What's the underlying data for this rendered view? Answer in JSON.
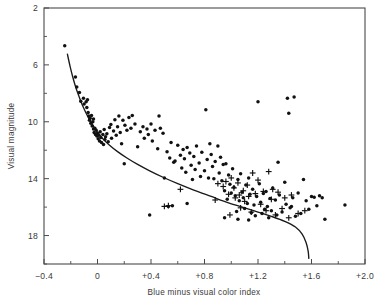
{
  "chart_data": {
    "type": "scatter",
    "title": "",
    "xlabel": "Blue minus visual color index",
    "ylabel": "Visual magnitude",
    "xlim": [
      -0.4,
      2.0
    ],
    "ylim": [
      2,
      20
    ],
    "y_inverted": true,
    "grid": false,
    "legend": "none",
    "xticks": [
      -0.4,
      0,
      0.4,
      0.8,
      1.2,
      1.6,
      2.0
    ],
    "xtick_labels": [
      "−0.4",
      "0",
      "+0.4",
      "+0.8",
      "+1.2",
      "+1.6",
      "+2.0"
    ],
    "yticks": [
      2,
      6,
      10,
      14,
      18
    ],
    "ytick_labels": [
      "2",
      "6",
      "10",
      "14",
      "18"
    ],
    "x_minor_interval": 0.2,
    "y_minor_interval": 2,
    "series": [
      {
        "name": "dot-markers",
        "marker": "dot",
        "points": [
          [
            -0.245,
            4.65
          ],
          [
            -0.165,
            6.85
          ],
          [
            -0.155,
            7.55
          ],
          [
            -0.135,
            7.95
          ],
          [
            -0.125,
            8.55
          ],
          [
            -0.105,
            8.35
          ],
          [
            -0.1,
            8.75
          ],
          [
            -0.085,
            8.6
          ],
          [
            -0.08,
            9.0
          ],
          [
            -0.075,
            8.45
          ],
          [
            -0.07,
            9.35
          ],
          [
            -0.065,
            9.6
          ],
          [
            -0.06,
            9.9
          ],
          [
            -0.055,
            9.75
          ],
          [
            -0.05,
            10.1
          ],
          [
            -0.045,
            9.55
          ],
          [
            -0.04,
            10.3
          ],
          [
            -0.035,
            10.0
          ],
          [
            -0.03,
            10.5
          ],
          [
            -0.03,
            9.8
          ],
          [
            -0.025,
            10.75
          ],
          [
            -0.02,
            10.45
          ],
          [
            -0.015,
            10.9
          ],
          [
            -0.01,
            10.6
          ],
          [
            -0.005,
            11.0
          ],
          [
            0.0,
            10.8
          ],
          [
            0.005,
            11.2
          ],
          [
            0.01,
            10.95
          ],
          [
            0.015,
            11.35
          ],
          [
            0.02,
            10.7
          ],
          [
            0.025,
            11.1
          ],
          [
            0.03,
            11.45
          ],
          [
            0.04,
            10.9
          ],
          [
            0.045,
            11.6
          ],
          [
            0.05,
            10.55
          ],
          [
            0.055,
            11.25
          ],
          [
            0.06,
            11.05
          ],
          [
            0.07,
            10.85
          ],
          [
            0.08,
            11.4
          ],
          [
            0.09,
            10.4
          ],
          [
            0.1,
            10.2
          ],
          [
            0.105,
            11.15
          ],
          [
            0.12,
            10.65
          ],
          [
            0.13,
            9.85
          ],
          [
            0.14,
            10.95
          ],
          [
            0.15,
            10.35
          ],
          [
            0.16,
            9.6
          ],
          [
            0.17,
            10.75
          ],
          [
            0.18,
            11.55
          ],
          [
            0.19,
            9.9
          ],
          [
            0.2,
            12.95
          ],
          [
            0.205,
            10.25
          ],
          [
            0.22,
            10.6
          ],
          [
            0.235,
            9.7
          ],
          [
            0.25,
            10.45
          ],
          [
            0.26,
            9.55
          ],
          [
            0.28,
            10.15
          ],
          [
            0.3,
            11.75
          ],
          [
            0.32,
            10.7
          ],
          [
            0.34,
            10.35
          ],
          [
            0.35,
            11.15
          ],
          [
            0.37,
            10.5
          ],
          [
            0.38,
            10.9
          ],
          [
            0.4,
            10.15
          ],
          [
            0.41,
            11.35
          ],
          [
            0.43,
            10.6
          ],
          [
            0.45,
            11.9
          ],
          [
            0.46,
            9.6
          ],
          [
            0.47,
            10.45
          ],
          [
            0.49,
            10.8
          ],
          [
            0.5,
            13.95
          ],
          [
            0.52,
            12.1
          ],
          [
            0.54,
            12.55
          ],
          [
            0.55,
            11.45
          ],
          [
            0.57,
            12.85
          ],
          [
            0.58,
            12.75
          ],
          [
            0.6,
            11.65
          ],
          [
            0.62,
            12.35
          ],
          [
            0.63,
            13.25
          ],
          [
            0.64,
            11.95
          ],
          [
            0.65,
            12.6
          ],
          [
            0.66,
            13.55
          ],
          [
            0.67,
            11.8
          ],
          [
            0.69,
            12.2
          ],
          [
            0.7,
            13.05
          ],
          [
            0.71,
            14.05
          ],
          [
            0.72,
            12.45
          ],
          [
            0.73,
            13.35
          ],
          [
            0.74,
            11.7
          ],
          [
            0.76,
            12.9
          ],
          [
            0.77,
            13.85
          ],
          [
            0.78,
            12.15
          ],
          [
            0.8,
            13.45
          ],
          [
            0.81,
            9.15
          ],
          [
            0.82,
            12.65
          ],
          [
            0.83,
            13.95
          ],
          [
            0.84,
            11.55
          ],
          [
            0.85,
            12.3
          ],
          [
            0.86,
            13.15
          ],
          [
            0.87,
            14.0
          ],
          [
            0.88,
            12.8
          ],
          [
            0.9,
            11.7
          ],
          [
            0.91,
            13.6
          ],
          [
            0.92,
            12.5
          ],
          [
            0.93,
            14.15
          ],
          [
            0.94,
            13.0
          ],
          [
            0.95,
            14.85
          ],
          [
            0.96,
            12.95
          ],
          [
            0.97,
            15.45
          ],
          [
            0.98,
            13.75
          ],
          [
            0.99,
            14.4
          ],
          [
            1.0,
            15.0
          ],
          [
            1.01,
            13.3
          ],
          [
            1.02,
            14.6
          ],
          [
            1.03,
            15.2
          ],
          [
            1.04,
            16.3
          ],
          [
            1.05,
            14.05
          ],
          [
            1.06,
            15.55
          ],
          [
            1.07,
            13.65
          ],
          [
            1.08,
            14.95
          ],
          [
            1.09,
            15.35
          ],
          [
            1.1,
            16.1
          ],
          [
            1.11,
            14.45
          ],
          [
            1.12,
            15.75
          ],
          [
            1.13,
            13.95
          ],
          [
            1.14,
            15.1
          ],
          [
            1.15,
            16.4
          ],
          [
            1.16,
            14.75
          ],
          [
            1.17,
            15.85
          ],
          [
            1.18,
            16.6
          ],
          [
            1.19,
            15.25
          ],
          [
            1.2,
            8.6
          ],
          [
            1.21,
            14.35
          ],
          [
            1.22,
            15.65
          ],
          [
            1.23,
            16.45
          ],
          [
            1.24,
            15.05
          ],
          [
            1.25,
            16.15
          ],
          [
            1.26,
            14.9
          ],
          [
            1.27,
            15.95
          ],
          [
            1.28,
            16.75
          ],
          [
            1.29,
            15.4
          ],
          [
            1.3,
            16.25
          ],
          [
            1.31,
            14.65
          ],
          [
            1.33,
            15.5
          ],
          [
            1.34,
            16.55
          ],
          [
            1.35,
            12.85
          ],
          [
            1.36,
            15.15
          ],
          [
            1.38,
            16.35
          ],
          [
            1.4,
            14.25
          ],
          [
            1.41,
            15.8
          ],
          [
            1.42,
            8.35
          ],
          [
            1.43,
            9.4
          ],
          [
            1.44,
            16.05
          ],
          [
            1.46,
            15.35
          ],
          [
            1.47,
            8.25
          ],
          [
            1.48,
            16.65
          ],
          [
            1.5,
            15.0
          ],
          [
            1.52,
            16.45
          ],
          [
            1.54,
            14.05
          ],
          [
            1.56,
            15.55
          ],
          [
            1.58,
            16.15
          ],
          [
            1.6,
            15.25
          ],
          [
            1.62,
            15.3
          ],
          [
            1.64,
            15.9
          ],
          [
            1.66,
            15.2
          ],
          [
            1.68,
            15.35
          ],
          [
            1.7,
            16.85
          ],
          [
            1.85,
            15.85
          ],
          [
            0.39,
            16.55
          ],
          [
            0.53,
            15.95
          ],
          [
            0.56,
            15.9
          ],
          [
            0.67,
            15.75
          ],
          [
            0.95,
            16.75
          ],
          [
            1.13,
            16.9
          ],
          [
            1.45,
            15.95
          ],
          [
            1.05,
            16.85
          ]
        ]
      },
      {
        "name": "plus-markers",
        "marker": "plus",
        "points": [
          [
            0.5,
            15.95
          ],
          [
            0.53,
            15.9
          ],
          [
            0.62,
            14.75
          ],
          [
            0.88,
            15.5
          ],
          [
            0.94,
            14.55
          ],
          [
            0.96,
            14.2
          ],
          [
            0.98,
            15.1
          ],
          [
            1.0,
            13.95
          ],
          [
            1.02,
            14.65
          ],
          [
            1.03,
            15.35
          ],
          [
            1.05,
            14.3
          ],
          [
            1.06,
            15.15
          ],
          [
            1.07,
            16.05
          ],
          [
            1.09,
            14.85
          ],
          [
            1.1,
            15.6
          ],
          [
            1.12,
            14.45
          ],
          [
            1.13,
            15.25
          ],
          [
            1.15,
            16.35
          ],
          [
            1.16,
            13.6
          ],
          [
            1.18,
            15.05
          ],
          [
            1.2,
            14.1
          ],
          [
            1.22,
            15.8
          ],
          [
            1.24,
            14.9
          ],
          [
            1.26,
            16.25
          ],
          [
            1.28,
            13.5
          ],
          [
            1.3,
            15.45
          ],
          [
            1.33,
            16.55
          ],
          [
            1.35,
            14.95
          ],
          [
            1.38,
            16.1
          ],
          [
            1.4,
            15.35
          ],
          [
            1.43,
            16.75
          ],
          [
            1.45,
            15.15
          ],
          [
            1.5,
            16.45
          ],
          [
            1.55,
            16.25
          ],
          [
            0.99,
            16.55
          ],
          [
            0.9,
            14.35
          ],
          [
            1.31,
            14.75
          ]
        ]
      }
    ],
    "fit_curve": {
      "name": "main-sequence-fit",
      "points": [
        [
          -0.225,
          5.25
        ],
        [
          -0.205,
          6.1
        ],
        [
          -0.185,
          6.85
        ],
        [
          -0.165,
          7.5
        ],
        [
          -0.145,
          8.05
        ],
        [
          -0.125,
          8.55
        ],
        [
          -0.105,
          9.0
        ],
        [
          -0.085,
          9.4
        ],
        [
          -0.06,
          9.85
        ],
        [
          -0.03,
          10.3
        ],
        [
          0.0,
          10.75
        ],
        [
          0.04,
          11.2
        ],
        [
          0.09,
          11.65
        ],
        [
          0.15,
          12.1
        ],
        [
          0.22,
          12.55
        ],
        [
          0.3,
          13.0
        ],
        [
          0.39,
          13.45
        ],
        [
          0.49,
          13.9
        ],
        [
          0.6,
          14.35
        ],
        [
          0.72,
          14.8
        ],
        [
          0.85,
          15.25
        ],
        [
          0.98,
          15.7
        ],
        [
          1.1,
          16.05
        ],
        [
          1.2,
          16.35
        ],
        [
          1.3,
          16.65
        ],
        [
          1.4,
          17.0
        ],
        [
          1.48,
          17.4
        ],
        [
          1.53,
          17.9
        ],
        [
          1.56,
          18.5
        ],
        [
          1.575,
          19.1
        ],
        [
          1.58,
          19.6
        ]
      ]
    }
  }
}
